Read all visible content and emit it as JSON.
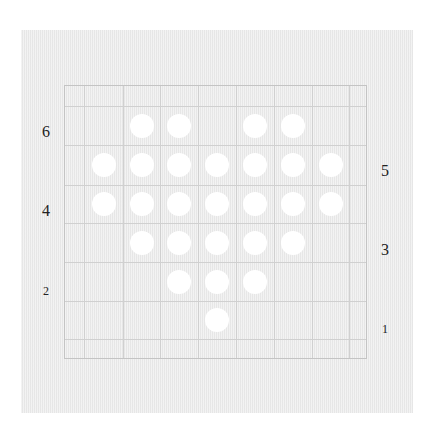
{
  "board": {
    "columns": 7,
    "rows": 6,
    "col_lines_x": [
      84,
      123,
      160,
      198,
      236,
      274,
      312,
      349
    ],
    "row_lines_y": [
      106,
      145,
      185,
      223,
      262,
      301,
      339
    ],
    "cell_centers_x": [
      103.5,
      141.5,
      179,
      217,
      255,
      293,
      330.5
    ],
    "cell_centers_y": [
      125.5,
      165,
      204,
      242.5,
      281.5,
      320
    ],
    "pegs": [
      [
        0,
        1,
        1,
        0,
        1,
        1,
        0
      ],
      [
        1,
        1,
        1,
        1,
        1,
        1,
        1
      ],
      [
        1,
        1,
        1,
        1,
        1,
        1,
        1
      ],
      [
        0,
        1,
        1,
        1,
        1,
        1,
        0
      ],
      [
        0,
        0,
        1,
        1,
        1,
        0,
        0
      ],
      [
        0,
        0,
        0,
        1,
        0,
        0,
        0
      ]
    ],
    "peg_color": "#ffffff",
    "background_color": "#ececec",
    "grid_color": "#d0d0d0"
  },
  "labels": {
    "left": [
      {
        "text": "6",
        "x": 46,
        "y": 132,
        "small": false
      },
      {
        "text": "4",
        "x": 46,
        "y": 211,
        "small": false
      },
      {
        "text": "2",
        "x": 46,
        "y": 291,
        "small": true
      }
    ],
    "right": [
      {
        "text": "5",
        "x": 385,
        "y": 171,
        "small": false
      },
      {
        "text": "3",
        "x": 385,
        "y": 250,
        "small": false
      },
      {
        "text": "1",
        "x": 385,
        "y": 329,
        "small": true
      }
    ]
  }
}
